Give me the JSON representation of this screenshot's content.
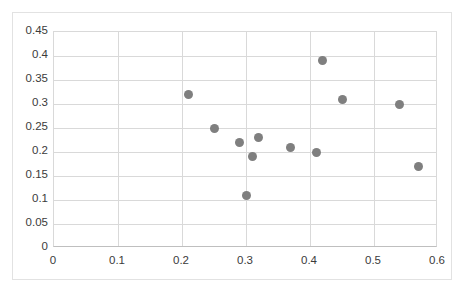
{
  "chart_data": {
    "type": "scatter",
    "title": "",
    "subtitle": "",
    "xlabel": "",
    "ylabel": "",
    "xlim": [
      0,
      0.6
    ],
    "ylim": [
      0,
      0.45
    ],
    "grid": true,
    "legend": null,
    "legend_position": "none",
    "marker_color": "#7f7f7f",
    "marker_shape": "circle",
    "xticks": [
      0,
      0.1,
      0.2,
      0.3,
      0.4,
      0.5,
      0.6
    ],
    "yticks": [
      0,
      0.05,
      0.1,
      0.15,
      0.2,
      0.25,
      0.3,
      0.35,
      0.4,
      0.45
    ],
    "xtick_labels": [
      "0",
      "0.1",
      "0.2",
      "0.3",
      "0.4",
      "0.5",
      "0.6"
    ],
    "ytick_labels": [
      "0",
      "0.05",
      "0.1",
      "0.15",
      "0.2",
      "0.25",
      "0.3",
      "0.35",
      "0.4",
      "0.45"
    ],
    "series": [
      {
        "name": "Series 1",
        "points": [
          {
            "x": 0.21,
            "y": 0.32
          },
          {
            "x": 0.25,
            "y": 0.25
          },
          {
            "x": 0.29,
            "y": 0.22
          },
          {
            "x": 0.3,
            "y": 0.11
          },
          {
            "x": 0.31,
            "y": 0.19
          },
          {
            "x": 0.32,
            "y": 0.23
          },
          {
            "x": 0.37,
            "y": 0.21
          },
          {
            "x": 0.41,
            "y": 0.2
          },
          {
            "x": 0.42,
            "y": 0.39
          },
          {
            "x": 0.45,
            "y": 0.31
          },
          {
            "x": 0.54,
            "y": 0.3
          },
          {
            "x": 0.57,
            "y": 0.17
          }
        ]
      }
    ]
  },
  "colors": {
    "marker": "#7f7f7f",
    "gridline": "#d9d9d9",
    "axis": "#bfbfbf",
    "frame": "#e2e2e2",
    "tick_text": "#3b3b3b",
    "background": "#ffffff"
  }
}
